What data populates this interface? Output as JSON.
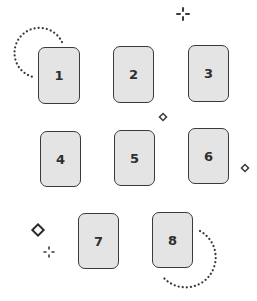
{
  "colors": {
    "card_fill": "#e4e4e4",
    "card_border": "#3a3a3a",
    "text": "#2f2f2f",
    "decoration": "#3a3a3a"
  },
  "cards": [
    {
      "label": "1",
      "x": 38,
      "y": 47,
      "w": 42,
      "h": 57
    },
    {
      "label": "2",
      "x": 113,
      "y": 46,
      "w": 41,
      "h": 57
    },
    {
      "label": "3",
      "x": 188,
      "y": 45,
      "w": 41,
      "h": 57
    },
    {
      "label": "4",
      "x": 40,
      "y": 131,
      "w": 41,
      "h": 56
    },
    {
      "label": "5",
      "x": 114,
      "y": 130,
      "w": 41,
      "h": 56
    },
    {
      "label": "6",
      "x": 188,
      "y": 128,
      "w": 41,
      "h": 56
    },
    {
      "label": "7",
      "x": 78,
      "y": 213,
      "w": 41,
      "h": 56
    },
    {
      "label": "8",
      "x": 152,
      "y": 212,
      "w": 41,
      "h": 56
    }
  ],
  "decorations": [
    {
      "type": "dotted-arc",
      "position": "top-left"
    },
    {
      "type": "dotted-arc",
      "position": "bottom-right"
    },
    {
      "type": "sparkle-icon",
      "x": 183,
      "y": 14
    },
    {
      "type": "sparkle-icon",
      "x": 49,
      "y": 252
    },
    {
      "type": "diamond-icon",
      "x": 163,
      "y": 117
    },
    {
      "type": "diamond-icon",
      "x": 245,
      "y": 168
    },
    {
      "type": "diamond-icon",
      "x": 38,
      "y": 230
    }
  ]
}
